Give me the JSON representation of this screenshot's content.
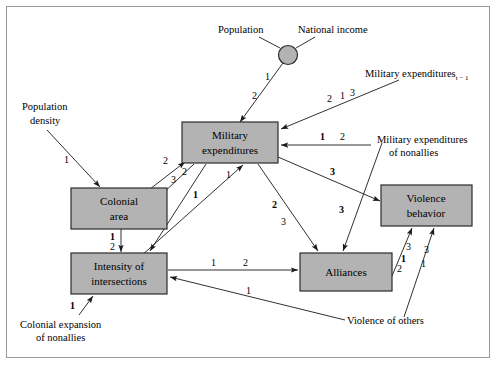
{
  "figure": {
    "frame_color": "#9a9a9a",
    "box_fill": "#b3b3b3",
    "box_stroke": "#2b2b2b"
  },
  "nodes": {
    "military_expenditures": {
      "line1": "Military",
      "line2": "expenditures"
    },
    "colonial_area": {
      "line1": "Colonial",
      "line2": "area"
    },
    "intensity_of_intersections": {
      "line1": "Intensity of",
      "line2": "intersections"
    },
    "alliances": {
      "line1": "Alliances",
      "line2": ""
    },
    "violence_behavior": {
      "line1": "Violence",
      "line2": "behavior"
    },
    "junction": {
      "label": ""
    }
  },
  "exogenous_labels": {
    "population": "Population",
    "national_income": "National income",
    "population_density_l1": "Population",
    "population_density_l2": "density",
    "military_expenditures_lag": "Military expenditures",
    "military_expenditures_lag_sub": "t − 1",
    "military_expenditures_nonallies_l1": "Military expenditures",
    "military_expenditures_nonallies_l2": "of nonallies",
    "colonial_expansion_nonallies_l1": "Colonial expansion",
    "colonial_expansion_nonallies_l2": "of nonallies",
    "violence_of_others": "Violence of others"
  },
  "edges": [
    {
      "id": "population-to-junction",
      "from": "Population",
      "to": "junction",
      "labels": []
    },
    {
      "id": "national-income-to-junction",
      "from": "National income",
      "to": "junction",
      "labels": []
    },
    {
      "id": "junction-to-military-expenditures",
      "from": "junction",
      "to": "Military expenditures",
      "labels": [
        "1",
        "2"
      ]
    },
    {
      "id": "military-expenditures-lag-to-military-expenditures",
      "from": "Military expenditures t-1",
      "to": "Military expenditures",
      "labels": [
        "2",
        "1",
        "3"
      ]
    },
    {
      "id": "military-expenditures-nonallies-to-military-expenditures",
      "from": "Military expenditures of nonallies",
      "to": "Military expenditures",
      "labels": [
        "1",
        "2"
      ]
    },
    {
      "id": "population-density-to-colonial-area",
      "from": "Population density",
      "to": "Colonial area",
      "labels": [
        "1"
      ]
    },
    {
      "id": "colonial-area-to-military-expenditures",
      "from": "Colonial area",
      "to": "Military expenditures",
      "labels": [
        "2"
      ]
    },
    {
      "id": "military-expenditures-to-colonial-area",
      "from": "Military expenditures",
      "to": "Colonial area",
      "labels": [
        "3",
        "2"
      ]
    },
    {
      "id": "colonial-area-to-intensity",
      "from": "Colonial area",
      "to": "Intensity of intersections",
      "labels": [
        "1",
        "2"
      ]
    },
    {
      "id": "military-expenditures-to-intensity",
      "from": "Military expenditures",
      "to": "Intensity of intersections",
      "labels": [
        "1"
      ]
    },
    {
      "id": "intensity-to-military-expenditures",
      "from": "Intensity of intersections",
      "to": "Military expenditures",
      "labels": [
        "1"
      ]
    },
    {
      "id": "military-expenditures-to-alliances",
      "from": "Military expenditures",
      "to": "Alliances",
      "labels": [
        "2",
        "3"
      ]
    },
    {
      "id": "military-expenditures-to-violence-behavior",
      "from": "Military expenditures",
      "to": "Violence behavior",
      "labels": [
        "3"
      ]
    },
    {
      "id": "military-expenditures-nonallies-to-alliances",
      "from": "Military expenditures of nonallies",
      "to": "Alliances",
      "labels": [
        "3"
      ]
    },
    {
      "id": "intensity-to-alliances",
      "from": "Intensity of intersections",
      "to": "Alliances",
      "labels": [
        "1",
        "2"
      ]
    },
    {
      "id": "alliances-to-violence-behavior",
      "from": "Alliances",
      "to": "Violence behavior",
      "labels": [
        "3",
        "1",
        "2"
      ]
    },
    {
      "id": "violence-of-others-to-violence-behavior",
      "from": "Violence of others",
      "to": "Violence behavior",
      "labels": [
        "3",
        "1"
      ]
    },
    {
      "id": "violence-of-others-to-intensity",
      "from": "Violence of others",
      "to": "Intensity of intersections",
      "labels": [
        "1"
      ]
    },
    {
      "id": "colonial-expansion-nonallies-to-intensity",
      "from": "Colonial expansion of nonallies",
      "to": "Intensity of intersections",
      "labels": [
        "1"
      ]
    }
  ],
  "edge_numbers": {
    "junction_1": "1",
    "junction_2": "2",
    "lag_2": "2",
    "lag_1": "1",
    "lag_3": "3",
    "nonallies_me_1": "1",
    "nonallies_me_2": "2",
    "popdens_1": "1",
    "ca_to_me_2": "2",
    "me_to_ca_3": "3",
    "me_to_ca_2": "2",
    "ca_to_ii_1": "1",
    "ca_to_ii_2": "2",
    "me_to_ii_1": "1",
    "ii_to_me_1": "1",
    "me_to_al_2": "2",
    "me_to_al_3": "3",
    "me_to_vb_3": "3",
    "nonallies_to_al_3": "3",
    "ii_to_al_1": "1",
    "ii_to_al_2": "2",
    "al_to_vb_3": "3",
    "al_to_vb_1": "1",
    "al_to_vb_2": "2",
    "vo_to_vb_3": "3",
    "vo_to_vb_1": "1",
    "vo_to_ii_1": "1",
    "cen_to_ii_1": "1"
  }
}
